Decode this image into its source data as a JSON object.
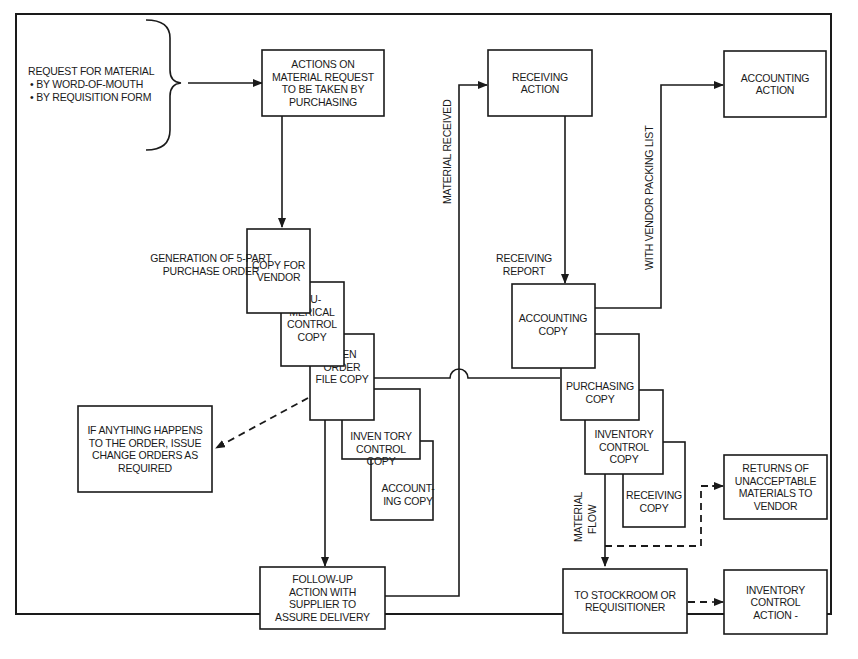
{
  "diagram": {
    "source_label": {
      "title": "REQUEST FOR MATERIAL",
      "bullets": [
        "• BY WORD-OF-MOUTH",
        "• BY REQUISITION FORM"
      ]
    },
    "boxes": {
      "purchasing_action": [
        "ACTIONS ON",
        "MATERIAL REQUEST",
        "TO BE TAKEN BY",
        "PURCHASING"
      ],
      "receiving_action": [
        "RECEIVING",
        "ACTION"
      ],
      "accounting_action": [
        "ACCOUNTING",
        "ACTION"
      ],
      "copy_for_vendor": [
        "COPY FOR",
        "VENDOR"
      ],
      "numerical_control_copy": [
        "NU-",
        "MERICAL",
        "CONTROL",
        "COPY"
      ],
      "open_order_file_copy": [
        "OPEN",
        "ORDER",
        "FILE COPY"
      ],
      "po_inventory_control_copy": [
        "INVEN TORY",
        "CONTROL",
        "COPY"
      ],
      "po_accounting_copy": [
        "ACCOUNT-",
        "ING COPY"
      ],
      "change_orders": [
        "IF ANYTHING HAPPENS",
        "TO THE ORDER, ISSUE",
        "CHANGE ORDERS AS",
        "REQUIRED"
      ],
      "follow_up": [
        "FOLLOW-UP",
        "ACTION WITH",
        "SUPPLIER TO",
        "ASSURE DELIVERY"
      ],
      "rr_accounting_copy": [
        "ACCOUNTING",
        "COPY"
      ],
      "rr_purchasing_copy": [
        "PURCHASING",
        "COPY"
      ],
      "rr_inventory_control_copy": [
        "INVENTORY",
        "CONTROL",
        "COPY"
      ],
      "rr_receiving_copy": [
        "RECEIVING",
        "COPY"
      ],
      "returns": [
        "RETURNS OF",
        "UNACCEPTABLE",
        "MATERIALS TO",
        "VENDOR"
      ],
      "stockroom": [
        "TO STOCKROOM OR",
        "REQUISITIONER"
      ],
      "inventory_control_action": [
        "INVENTORY",
        "CONTROL",
        "ACTION -"
      ]
    },
    "labels": {
      "generation": [
        "GENERATION OF 5-PART",
        "PURCHASE ORDER"
      ],
      "receiving_report": [
        "RECEIVING",
        "REPORT"
      ],
      "material_received": "MATERIAL RECEIVED",
      "with_vendor_packing_list": "WITH VENDOR PACKING LIST",
      "material_flow": [
        "MATERIAL",
        "FLOW"
      ]
    }
  }
}
